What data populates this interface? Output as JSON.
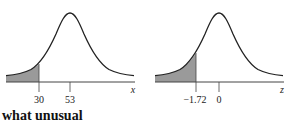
{
  "figures": [
    {
      "name": "normal-curve-x",
      "axis_variable": "x",
      "mean_label": "53",
      "cutoff_label": "30",
      "shaded_region": "left tail below 30"
    },
    {
      "name": "standard-normal-curve-z",
      "axis_variable": "z",
      "mean_label": "0",
      "cutoff_label": "−1.72",
      "shaded_region": "left tail below -1.72"
    }
  ],
  "caption_fragment": "what unusual",
  "colors": {
    "curve": "#222222",
    "shade": "#9a9a9a",
    "axis": "#444444"
  }
}
